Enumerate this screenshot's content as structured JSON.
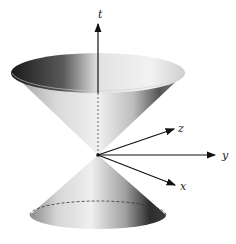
{
  "figure": {
    "type": "double-cone (light cone) diagram",
    "axes": {
      "t": "t",
      "x": "x",
      "y": "y",
      "z": "z"
    },
    "colors": {
      "background": "#ffffff",
      "axis": "#111111",
      "surface_light": "#f2f2f2",
      "surface_dark": "#2a2a2a"
    }
  }
}
